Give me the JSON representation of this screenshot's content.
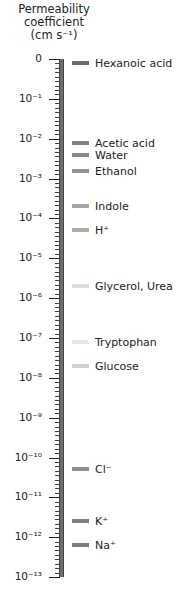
{
  "chart_data": {
    "type": "scatter",
    "title": "Permeability coefficient (cm s⁻¹)",
    "title_lines": [
      "Permeability",
      "coefficient",
      "(cm s⁻¹)"
    ],
    "xlabel": "",
    "ylabel": "Permeability coefficient (cm s⁻¹)",
    "yscale": "log",
    "ylim": [
      1e-13,
      1
    ],
    "grid": false,
    "legend": "none",
    "tick_labels": [
      "0",
      "10⁻¹",
      "10⁻²",
      "10⁻³",
      "10⁻⁴",
      "10⁻⁵",
      "10⁻⁶",
      "10⁻⁷",
      "10⁻⁸",
      "10⁻⁹",
      "10⁻¹⁰",
      "10⁻¹¹",
      "10⁻¹²",
      "10⁻¹³"
    ],
    "tick_exponents": [
      0,
      -1,
      -2,
      -3,
      -4,
      -5,
      -6,
      -7,
      -8,
      -9,
      -10,
      -11,
      -12,
      -13
    ],
    "series": [
      {
        "name": "Hexanoic acid",
        "log10_value": -0.1,
        "color": "#6b6b6b"
      },
      {
        "name": "Acetic acid",
        "log10_value": -2.1,
        "color": "#808080"
      },
      {
        "name": "Water",
        "log10_value": -2.4,
        "color": "#8a8a8a"
      },
      {
        "name": "Ethanol",
        "log10_value": -2.8,
        "color": "#939393"
      },
      {
        "name": "Indole",
        "log10_value": -3.7,
        "color": "#a6a6a6"
      },
      {
        "name": "H⁺",
        "log10_value": -4.3,
        "color": "#acacac"
      },
      {
        "name": "Glycerol, Urea",
        "log10_value": -5.7,
        "color": "#dddddd"
      },
      {
        "name": "Tryptophan",
        "log10_value": -7.1,
        "color": "#e6e6e6"
      },
      {
        "name": "Glucose",
        "log10_value": -7.7,
        "color": "#cfcfcf"
      },
      {
        "name": "Cl⁻",
        "log10_value": -10.3,
        "color": "#8e8e8e"
      },
      {
        "name": "K⁺",
        "log10_value": -11.6,
        "color": "#7f7f7f"
      },
      {
        "name": "Na⁺",
        "log10_value": -12.2,
        "color": "#7c7c7c"
      }
    ]
  }
}
